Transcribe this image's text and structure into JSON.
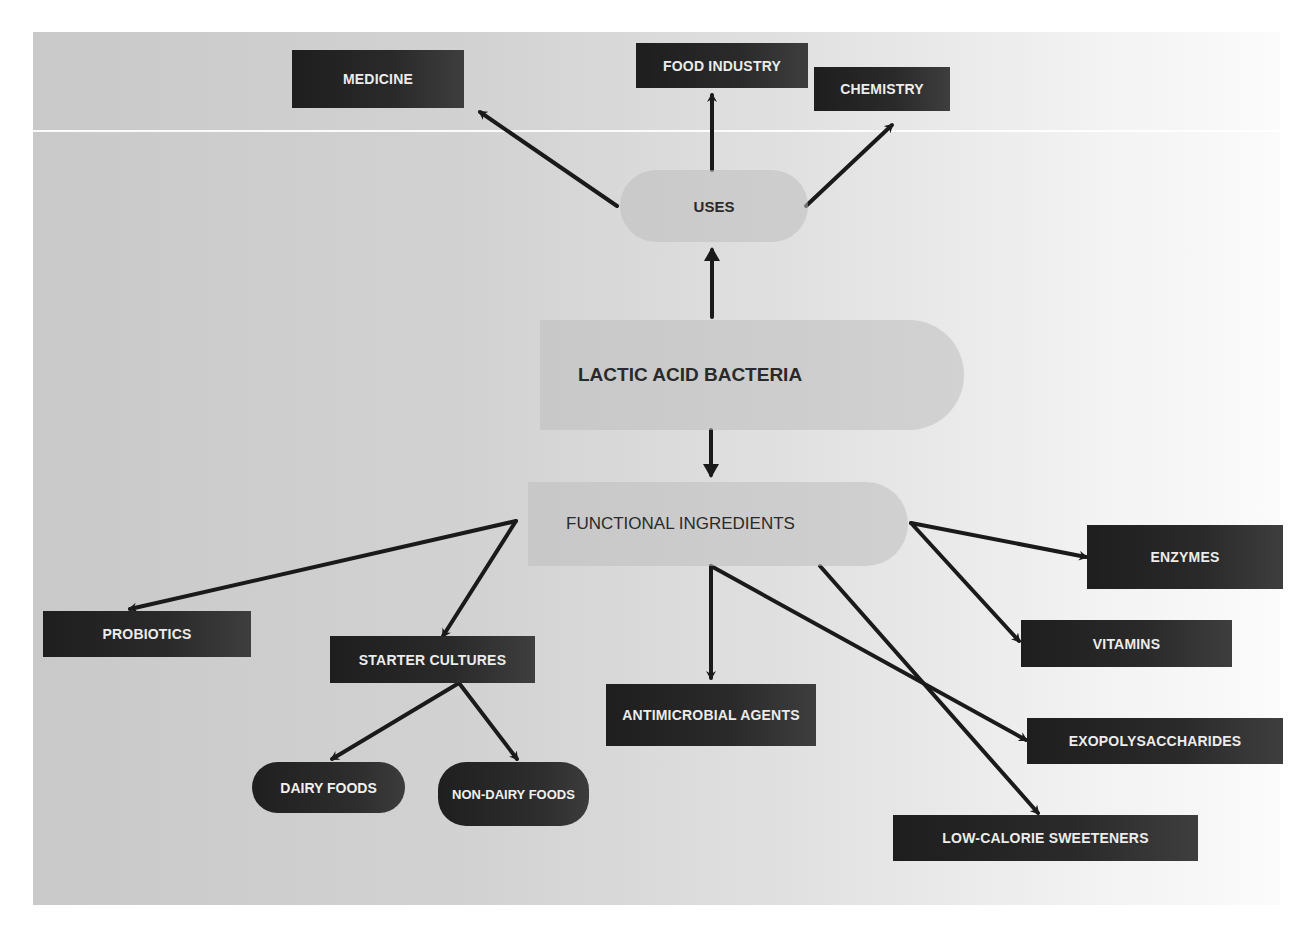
{
  "diagram": {
    "colors": {
      "box_fill": "#262626",
      "box_text": "#ececec",
      "pill_fill": "#bebebe",
      "edge": "#1a1a1a"
    },
    "central_node": {
      "id": "lab",
      "label": "LACTIC ACID BACTERIA"
    },
    "hubs": [
      {
        "id": "uses",
        "label": "USES"
      },
      {
        "id": "functional",
        "label": "FUNCTIONAL INGREDIENTS"
      }
    ],
    "uses": [
      {
        "id": "medicine",
        "label": "MEDICINE"
      },
      {
        "id": "food_industry",
        "label": "FOOD INDUSTRY"
      },
      {
        "id": "chemistry",
        "label": "CHEMISTRY"
      }
    ],
    "functional_ingredients": [
      {
        "id": "probiotics",
        "label": "PROBIOTICS"
      },
      {
        "id": "starter_cultures",
        "label": "STARTER CULTURES"
      },
      {
        "id": "antimicrobial_agents",
        "label": "ANTIMICROBIAL AGENTS"
      },
      {
        "id": "enzymes",
        "label": "ENZYMES"
      },
      {
        "id": "vitamins",
        "label": "VITAMINS"
      },
      {
        "id": "exopolysaccharides",
        "label": "EXOPOLYSACCHARIDES"
      },
      {
        "id": "low_calorie_sweeteners",
        "label": "LOW-CALORIE SWEETENERS"
      }
    ],
    "starter_cultures_children": [
      {
        "id": "dairy_foods",
        "label": "DAIRY FOODS"
      },
      {
        "id": "non_dairy_foods",
        "label": "NON-DAIRY FOODS"
      }
    ],
    "edges": [
      [
        "lab",
        "uses"
      ],
      [
        "lab",
        "functional"
      ],
      [
        "uses",
        "medicine"
      ],
      [
        "uses",
        "food_industry"
      ],
      [
        "uses",
        "chemistry"
      ],
      [
        "functional",
        "probiotics"
      ],
      [
        "functional",
        "starter_cultures"
      ],
      [
        "functional",
        "antimicrobial_agents"
      ],
      [
        "functional",
        "enzymes"
      ],
      [
        "functional",
        "vitamins"
      ],
      [
        "functional",
        "exopolysaccharides"
      ],
      [
        "functional",
        "low_calorie_sweeteners"
      ],
      [
        "starter_cultures",
        "dairy_foods"
      ],
      [
        "starter_cultures",
        "non_dairy_foods"
      ]
    ]
  }
}
